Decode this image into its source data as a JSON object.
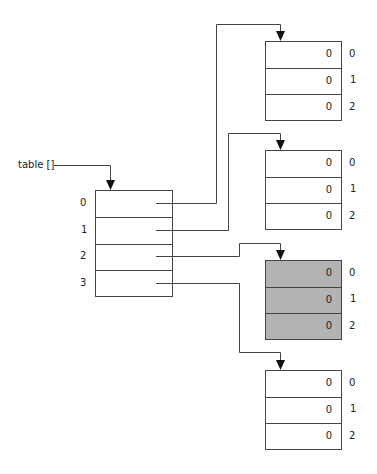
{
  "diagram": {
    "variable_label": "table []",
    "main_array": {
      "indices": [
        "0",
        "1",
        "2",
        "3"
      ]
    },
    "sub_arrays": [
      {
        "values": [
          "0",
          "0",
          "0"
        ],
        "indices": [
          "0",
          "1",
          "2"
        ],
        "highlighted": false
      },
      {
        "values": [
          "0",
          "0",
          "0"
        ],
        "indices": [
          "0",
          "1",
          "2"
        ],
        "highlighted": false
      },
      {
        "values": [
          "0",
          "0",
          "0"
        ],
        "indices": [
          "0",
          "1",
          "2"
        ],
        "highlighted": true
      },
      {
        "values": [
          "0",
          "0",
          "0"
        ],
        "indices": [
          "0",
          "1",
          "2"
        ],
        "highlighted": false
      }
    ],
    "colors": {
      "line": "#444444",
      "highlight_fill": "#b3b3b3",
      "background": "#ffffff"
    }
  }
}
